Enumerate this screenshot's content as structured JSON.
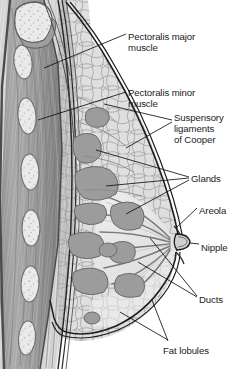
{
  "figure": {
    "type": "anatomical-illustration",
    "style": "grayscale line drawing",
    "caption": ""
  },
  "colors": {
    "background": "#ffffff",
    "outline": "#1a1a1a",
    "skin_fill": "#ececec",
    "fat_lobule_fill": "#dedede",
    "fat_lobule_edge": "#8d8d8d",
    "gland_fill": "#9c9c9c",
    "gland_edge": "#6f6f6f",
    "muscle_light": "#b9b9b9",
    "muscle_mid": "#9a9a9a",
    "muscle_dark": "#6e6e6e",
    "rib_fill": "#e6e6e6",
    "rib_edge": "#7a7a7a",
    "duct_stroke": "#7b7b7b",
    "label_text": "#1b1b1b"
  },
  "labels": [
    {
      "id": "pectoralis-major",
      "text": "Pectoralis major\nmuscle",
      "x": 128,
      "y": 31,
      "lines": 2
    },
    {
      "id": "pectoralis-minor",
      "text": "Pectoralis minor\nmuscle",
      "x": 128,
      "y": 87,
      "lines": 2
    },
    {
      "id": "suspensory-ligaments",
      "text": "Suspensory\nligaments\nof Cooper",
      "x": 174,
      "y": 112,
      "lines": 3
    },
    {
      "id": "glands",
      "text": "Glands",
      "x": 191,
      "y": 173,
      "lines": 1
    },
    {
      "id": "areola",
      "text": "Areola",
      "x": 199,
      "y": 205,
      "lines": 1
    },
    {
      "id": "nipple",
      "text": "Nipple",
      "x": 201,
      "y": 242,
      "lines": 1
    },
    {
      "id": "ducts",
      "text": "Ducts",
      "x": 199,
      "y": 294,
      "lines": 1
    },
    {
      "id": "fat-lobules",
      "text": "Fat lobules",
      "x": 163,
      "y": 345,
      "lines": 1
    }
  ],
  "structures": [
    {
      "id": "rib-cut-end",
      "name": "Cut end of rib (cancellous bone)"
    },
    {
      "id": "ribs",
      "name": "Ribs in cross-section"
    },
    {
      "id": "intercostal-muscle",
      "name": "Intercostal / chest wall muscle"
    },
    {
      "id": "pectoralis-major-muscle",
      "name": "Pectoralis major muscle"
    },
    {
      "id": "pectoralis-minor-muscle",
      "name": "Pectoralis minor muscle"
    },
    {
      "id": "suspensory-ligaments-of-cooper",
      "name": "Suspensory ligaments of Cooper"
    },
    {
      "id": "mammary-glands",
      "name": "Mammary glands / lobes"
    },
    {
      "id": "lactiferous-ducts",
      "name": "Lactiferous ducts"
    },
    {
      "id": "nipple-structure",
      "name": "Nipple"
    },
    {
      "id": "areola-structure",
      "name": "Areola"
    },
    {
      "id": "fat-lobules-structure",
      "name": "Fat lobules / adipose tissue"
    },
    {
      "id": "skin-contour",
      "name": "Skin outline of breast"
    }
  ]
}
